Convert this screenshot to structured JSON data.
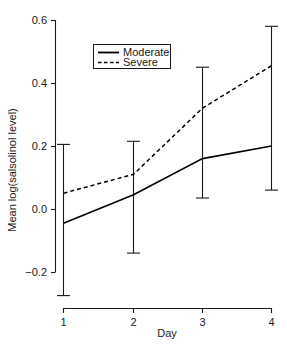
{
  "chart_data": {
    "type": "line",
    "title": "",
    "xlabel": "Day",
    "ylabel": "Mean log(salsolinol level)",
    "x": [
      1,
      2,
      3,
      4
    ],
    "xticklabels": [
      "1",
      "2",
      "3",
      "4"
    ],
    "yticklabels": [
      "0.6",
      "0.4",
      "0.2",
      "0.0",
      "−0.2"
    ],
    "yticks": [
      0.6,
      0.4,
      0.2,
      0.0,
      -0.2
    ],
    "ylim": [
      -0.2,
      0.6
    ],
    "xlim": [
      1,
      4
    ],
    "grid": false,
    "legend_position": "upper-left-inside",
    "series": [
      {
        "name": "Moderate",
        "style": "solid",
        "values": [
          -0.045,
          0.045,
          0.16,
          0.2
        ]
      },
      {
        "name": "Severe",
        "style": "dashed",
        "values": [
          0.05,
          0.11,
          0.32,
          0.455
        ]
      }
    ],
    "error_bars": [
      {
        "day": 1,
        "lower": -0.275,
        "upper": 0.205
      },
      {
        "day": 2,
        "lower": -0.14,
        "upper": 0.215
      },
      {
        "day": 3,
        "lower": 0.035,
        "upper": 0.45
      },
      {
        "day": 4,
        "lower": 0.06,
        "upper": 0.58
      }
    ],
    "legend_entries": [
      {
        "label": "Moderate",
        "style": "solid"
      },
      {
        "label": "Severe",
        "style": "dashed"
      }
    ]
  },
  "labels": {
    "ytick_0": "0.6",
    "ytick_1": "0.4",
    "ytick_2": "0.2",
    "ytick_3": "0.0",
    "ytick_4": "−0.2",
    "xtick_0": "1",
    "xtick_1": "2",
    "xtick_2": "3",
    "xtick_3": "4",
    "xaxis_title": "Day",
    "yaxis_title": "Mean log(salsolinol level)",
    "legend_moderate": "Moderate",
    "legend_severe": "Severe"
  }
}
